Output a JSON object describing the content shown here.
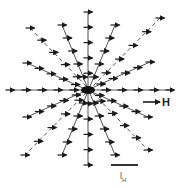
{
  "figure": {
    "field_label": "H",
    "scale_label_main": "l",
    "scale_label_sub": "H",
    "center": [
      88,
      90
    ],
    "colors": {
      "ink": "#1a1a1a",
      "line": "#555555",
      "background": "#ffffff"
    },
    "field_arrow": {
      "x1": 143,
      "y1": 102,
      "x2": 160,
      "y2": 102
    },
    "scale_bar": {
      "x1": 111,
      "y1": 165,
      "x2": 138,
      "y2": 165
    },
    "rays": [
      {
        "x1": 88,
        "y1": 12,
        "x2": 88,
        "y2": 165,
        "dashed": false
      },
      {
        "x1": 10,
        "y1": 90,
        "x2": 170,
        "y2": 90,
        "dashed": false
      },
      {
        "x1": 160,
        "y1": 18,
        "x2": 25,
        "y2": 155,
        "dashed": true
      },
      {
        "x1": 30,
        "y1": 28,
        "x2": 148,
        "y2": 150,
        "dashed": true
      },
      {
        "x1": 150,
        "y1": 62,
        "x2": 27,
        "y2": 117,
        "dashed": false
      },
      {
        "x1": 27,
        "y1": 63,
        "x2": 148,
        "y2": 117,
        "dashed": false
      },
      {
        "x1": 62,
        "y1": 25,
        "x2": 115,
        "y2": 155,
        "dashed": false
      },
      {
        "x1": 115,
        "y1": 25,
        "x2": 62,
        "y2": 155,
        "dashed": false
      }
    ],
    "arrows_per_ray": 10,
    "arrow_length": 9
  }
}
